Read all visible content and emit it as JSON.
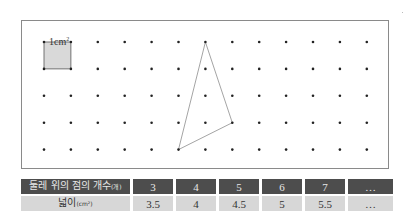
{
  "grid": {
    "columns": 13,
    "rows": 5,
    "spacing_px": 26.9,
    "origin_px": [
      43,
      41
    ],
    "unit_square": {
      "label": "1cm",
      "superscript": "2",
      "fill": "#d9d9d9",
      "cell": [
        0,
        0
      ]
    },
    "triangle": {
      "vertices_grid": [
        [
          6,
          0
        ],
        [
          7,
          3
        ],
        [
          5,
          4
        ]
      ],
      "stroke": "#9a9a9a"
    },
    "dot_color": "#222222"
  },
  "table": {
    "row_header_label": "둘레 위의 점의 개수",
    "row_header_unit": "(개)",
    "row_value_label": "넓이",
    "row_value_unit": "(cm²)",
    "points_on_perimeter": [
      "3",
      "4",
      "5",
      "6",
      "7",
      "…"
    ],
    "areas": [
      "3.5",
      "4",
      "4.5",
      "5",
      "5.5",
      "…"
    ]
  },
  "colors": {
    "header_bg": "#4d4d4d",
    "header_text": "#e8e8e8",
    "value_bg": "#d7d7d7",
    "value_text": "#333333",
    "frame_border": "#8a8a8a"
  }
}
